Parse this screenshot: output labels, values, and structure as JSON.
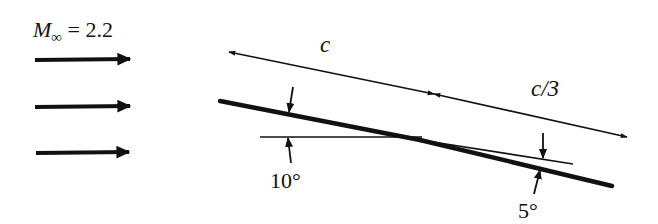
{
  "figure": {
    "freestream": {
      "symbol": "M",
      "subscript": "∞",
      "equals": "= 2.2",
      "mach_number": 2.2,
      "arrow_count": 3
    },
    "dimensions": {
      "main_chord_label": "c",
      "flap_chord_label": "c/3"
    },
    "angles": {
      "main_plate_angle_label": "10°",
      "flap_deflection_label": "5°",
      "main_plate_angle_deg": 10,
      "flap_deflection_deg": 5
    },
    "colors": {
      "ink": "#111111",
      "background": "#ffffff"
    }
  }
}
